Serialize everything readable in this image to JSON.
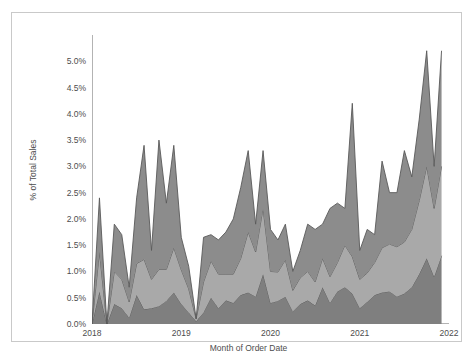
{
  "chart_data": {
    "type": "area",
    "stacked": true,
    "title": "",
    "subtitle": "",
    "xlabel": "Month of Order Date",
    "ylabel": "% of Total Sales",
    "grid": false,
    "legend": "none",
    "ylim": [
      0,
      5.5
    ],
    "ytick_labels": [
      "5.0%",
      "4.5%",
      "4.0%",
      "3.5%",
      "3.0%",
      "2.5%",
      "2.0%",
      "1.5%",
      "1.0%",
      "0.5%",
      "0.0%"
    ],
    "ytick_values": [
      5.0,
      4.5,
      4.0,
      3.5,
      3.0,
      2.5,
      2.0,
      1.5,
      1.0,
      0.5,
      0.0
    ],
    "xtick_labels": [
      "2018",
      "2019",
      "2020",
      "2021",
      "2022"
    ],
    "xtick_values": [
      0,
      12,
      24,
      36,
      48
    ],
    "xlim": [
      0,
      48
    ],
    "colors": {
      "series_bottom": "#7f7f7f",
      "series_middle": "#a9a9a9",
      "series_top": "#8c8c8c",
      "outline": "#595959",
      "axis": "#b3b3b3",
      "text": "#4d4d4d",
      "frame": "#c9c9c9",
      "background": "#ffffff"
    },
    "x": [
      0,
      1,
      2,
      3,
      4,
      5,
      6,
      7,
      8,
      9,
      10,
      11,
      12,
      13,
      14,
      15,
      16,
      17,
      18,
      19,
      20,
      21,
      22,
      23,
      24,
      25,
      26,
      27,
      28,
      29,
      30,
      31,
      32,
      33,
      34,
      35,
      36,
      37,
      38,
      39,
      40,
      41,
      42,
      43,
      44,
      45,
      46,
      47
    ],
    "x_labels": [
      "Jan 2018",
      "Feb 2018",
      "Mar 2018",
      "Apr 2018",
      "May 2018",
      "Jun 2018",
      "Jul 2018",
      "Aug 2018",
      "Sep 2018",
      "Oct 2018",
      "Nov 2018",
      "Dec 2018",
      "Jan 2019",
      "Feb 2019",
      "Mar 2019",
      "Apr 2019",
      "May 2019",
      "Jun 2019",
      "Jul 2019",
      "Aug 2019",
      "Sep 2019",
      "Oct 2019",
      "Nov 2019",
      "Dec 2019",
      "Jan 2020",
      "Feb 2020",
      "Mar 2020",
      "Apr 2020",
      "May 2020",
      "Jun 2020",
      "Jul 2020",
      "Aug 2020",
      "Sep 2020",
      "Oct 2020",
      "Nov 2020",
      "Dec 2020",
      "Jan 2021",
      "Feb 2021",
      "Mar 2021",
      "Apr 2021",
      "May 2021",
      "Jun 2021",
      "Jul 2021",
      "Aug 2021",
      "Sep 2021",
      "Oct 2021",
      "Nov 2021",
      "Dec 2021"
    ],
    "series": [
      {
        "name": "Series 1",
        "color": "#7f7f7f",
        "values": [
          0.0,
          0.62,
          0.0,
          0.38,
          0.3,
          0.12,
          0.55,
          0.28,
          0.3,
          0.34,
          0.44,
          0.6,
          0.38,
          0.22,
          0.05,
          0.22,
          0.5,
          0.3,
          0.45,
          0.4,
          0.55,
          0.6,
          0.52,
          0.95,
          0.4,
          0.44,
          0.52,
          0.24,
          0.38,
          0.45,
          0.35,
          0.7,
          0.4,
          0.62,
          0.7,
          0.58,
          0.3,
          0.42,
          0.55,
          0.6,
          0.62,
          0.52,
          0.58,
          0.7,
          0.95,
          1.25,
          0.9,
          1.3
        ]
      },
      {
        "name": "Series 2",
        "color": "#a9a9a9",
        "values": [
          0.0,
          0.75,
          0.0,
          0.62,
          0.55,
          0.3,
          0.6,
          0.95,
          0.55,
          0.7,
          0.6,
          0.85,
          0.65,
          0.45,
          0.05,
          0.58,
          0.7,
          0.65,
          0.5,
          0.55,
          0.7,
          1.15,
          0.85,
          1.25,
          0.6,
          0.55,
          0.7,
          0.4,
          0.5,
          0.55,
          0.45,
          0.55,
          0.5,
          0.55,
          0.8,
          0.7,
          0.55,
          0.55,
          0.62,
          0.85,
          0.9,
          0.95,
          0.98,
          1.1,
          1.4,
          1.75,
          1.3,
          1.7
        ]
      },
      {
        "name": "Series 3",
        "color": "#8c8c8c",
        "values": [
          0.0,
          1.03,
          0.0,
          0.9,
          0.85,
          0.28,
          1.25,
          2.17,
          0.55,
          2.46,
          1.26,
          1.95,
          0.62,
          0.43,
          0.0,
          0.85,
          0.5,
          0.65,
          0.8,
          1.05,
          1.35,
          1.55,
          0.53,
          1.1,
          0.8,
          0.61,
          0.68,
          0.36,
          0.52,
          0.9,
          1.0,
          0.65,
          1.3,
          1.13,
          0.7,
          2.92,
          0.55,
          0.83,
          0.53,
          1.65,
          0.98,
          1.03,
          1.74,
          1.0,
          1.55,
          2.2,
          0.8,
          2.2
        ]
      }
    ],
    "totals_note": "Stacked totals peak at approximately 5.2% in late 2021",
    "max_total": 5.2
  }
}
